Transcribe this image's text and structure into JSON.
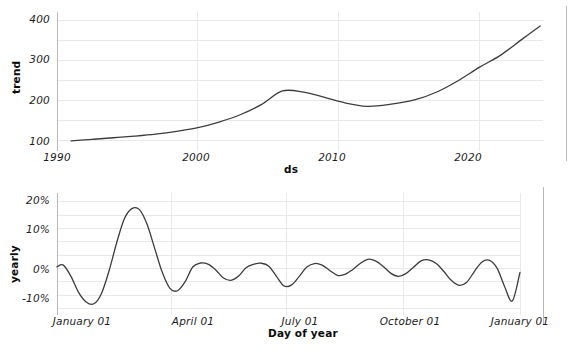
{
  "figure": {
    "background_color": "#ffffff",
    "grid_color": "#e9e9ec",
    "line_color": "#3c3c3c",
    "spine_color": "#b9b9bd"
  },
  "panels": {
    "trend": {
      "ylabel": "trend",
      "xlabel": "ds",
      "yticks": [
        "100",
        "200",
        "300",
        "400"
      ],
      "xticks": [
        "1990",
        "2000",
        "2010",
        "2020"
      ]
    },
    "yearly": {
      "ylabel": "yearly",
      "xlabel": "Day of year",
      "yticks": [
        "-10%",
        "0%",
        "10%",
        "20%"
      ],
      "xticks": [
        "January 01",
        "April 01",
        "July 01",
        "October 01",
        "January 01"
      ]
    }
  },
  "chart_data": [
    {
      "type": "line",
      "name": "trend",
      "title": "",
      "xlabel": "ds",
      "ylabel": "trend",
      "xlim": [
        1990,
        2024.5
      ],
      "ylim": [
        85,
        405
      ],
      "yticks": [
        100,
        200,
        300,
        400
      ],
      "xticks": [
        1990,
        2000,
        2010,
        2020
      ],
      "ytick_labels": [
        "100",
        "200",
        "300",
        "400"
      ],
      "xtick_labels": [
        "1990",
        "2000",
        "2010",
        "2020"
      ],
      "grid": true,
      "legend": "none",
      "x": [
        1991.0,
        1992.5,
        1994.0,
        1995.5,
        1997.0,
        1998.5,
        2000.0,
        2001.5,
        2003.0,
        2004.5,
        2006.0,
        2007.5,
        2009.0,
        2010.5,
        2012.0,
        2013.5,
        2015.5,
        2017.0,
        2018.5,
        2020.0,
        2021.5,
        2023.0,
        2024.3
      ],
      "values": [
        100,
        104,
        108,
        112,
        117,
        124,
        133,
        147,
        165,
        190,
        224,
        221,
        208,
        194,
        186,
        190,
        203,
        222,
        250,
        283,
        313,
        352,
        385
      ]
    },
    {
      "type": "line",
      "name": "yearly",
      "title": "",
      "xlabel": "Day of year",
      "ylabel": "yearly",
      "xlim": [
        1,
        366
      ],
      "ylim": [
        -16,
        26
      ],
      "yticks": [
        -10,
        0,
        10,
        20
      ],
      "ytick_labels": [
        "-10%",
        "0%",
        "10%",
        "20%"
      ],
      "xticks": [
        1,
        91,
        182,
        274,
        366
      ],
      "xtick_labels": [
        "January 01",
        "April 01",
        "July 01",
        "October 01",
        "January 01"
      ],
      "grid": true,
      "legend": "none",
      "units": "percent",
      "x": [
        1,
        6,
        12,
        18,
        24,
        30,
        36,
        42,
        48,
        54,
        60,
        66,
        72,
        78,
        84,
        90,
        96,
        102,
        108,
        114,
        120,
        126,
        132,
        138,
        144,
        150,
        156,
        162,
        168,
        174,
        180,
        186,
        192,
        198,
        204,
        210,
        216,
        222,
        228,
        234,
        240,
        246,
        252,
        258,
        264,
        270,
        276,
        282,
        288,
        294,
        300,
        306,
        312,
        318,
        324,
        330,
        336,
        342,
        348,
        354,
        360,
        366
      ],
      "values": [
        0.6,
        1.2,
        -3.0,
        -9.0,
        -12.6,
        -13.3,
        -9.5,
        -1.0,
        9.5,
        18.5,
        22.4,
        22.0,
        16.5,
        7.5,
        -1.5,
        -7.5,
        -8.4,
        -5.0,
        0.5,
        2.0,
        1.6,
        -0.5,
        -3.5,
        -4.5,
        -3.0,
        0.2,
        1.5,
        1.9,
        0.8,
        -3.0,
        -6.6,
        -6.2,
        -3.0,
        0.5,
        1.8,
        1.2,
        -0.8,
        -2.6,
        -2.3,
        -0.5,
        1.8,
        3.4,
        2.8,
        0.8,
        -1.8,
        -3.0,
        -2.0,
        0.4,
        2.8,
        3.2,
        1.8,
        -1.2,
        -4.6,
        -6.4,
        -5.2,
        -1.2,
        2.4,
        3.0,
        0.0,
        -7.0,
        -12.2,
        -1.5
      ]
    }
  ]
}
